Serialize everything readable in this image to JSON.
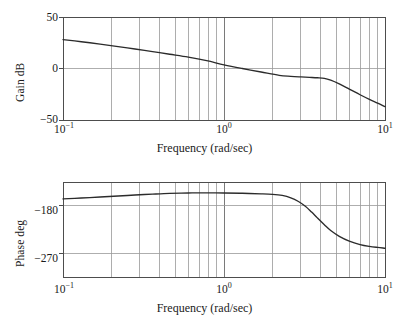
{
  "chart_data": [
    {
      "type": "line",
      "id": "gain",
      "title": "",
      "xlabel": "Frequency (rad/sec)",
      "ylabel": "Gain dB",
      "xscale": "log",
      "xlim": [
        0.1,
        10
      ],
      "ylim": [
        -50,
        50
      ],
      "grid": true,
      "legend": null,
      "xticks": [
        0.1,
        1,
        10
      ],
      "xticklabels": [
        "10−1",
        "10⁰",
        "10¹"
      ],
      "yticks": [
        50,
        0,
        -50
      ],
      "yticklabels": [
        "50",
        "0",
        "−50"
      ],
      "x": [
        0.1,
        0.13,
        0.17,
        0.22,
        0.28,
        0.36,
        0.46,
        0.6,
        0.78,
        1.0,
        1.3,
        1.7,
        2.2,
        2.6,
        3.0,
        3.4,
        3.8,
        4.2,
        4.6,
        5.2,
        6.0,
        7.0,
        8.0,
        9.0,
        10.0
      ],
      "values": [
        28.0,
        26.0,
        23.7,
        21.3,
        18.9,
        16.4,
        13.8,
        11.0,
        7.6,
        3.6,
        0.0,
        -3.4,
        -6.6,
        -7.6,
        -8.2,
        -8.6,
        -9.0,
        -9.6,
        -11.4,
        -15.0,
        -20.0,
        -25.5,
        -30.0,
        -33.6,
        -37.0
      ]
    },
    {
      "type": "line",
      "id": "phase",
      "title": "",
      "xlabel": "Frequency (rad/sec)",
      "ylabel": "Phase deg",
      "xscale": "log",
      "xlim": [
        0.1,
        10
      ],
      "ylim": [
        -315,
        -135
      ],
      "grid": true,
      "legend": null,
      "xticks": [
        0.1,
        1,
        10
      ],
      "xticklabels": [
        "10−1",
        "10⁰",
        "10¹"
      ],
      "yticks": [
        -180,
        -270
      ],
      "yticklabels": [
        "−180",
        "−270"
      ],
      "x": [
        0.1,
        0.13,
        0.17,
        0.22,
        0.28,
        0.36,
        0.46,
        0.6,
        0.78,
        1.0,
        1.3,
        1.7,
        2.0,
        2.3,
        2.6,
        2.9,
        3.2,
        3.5,
        3.8,
        4.2,
        4.6,
        5.2,
        6.0,
        7.0,
        8.0,
        9.0,
        10.0
      ],
      "values": [
        -167.0,
        -165.4,
        -163.5,
        -161.6,
        -159.7,
        -158.0,
        -156.6,
        -155.8,
        -155.6,
        -155.8,
        -156.4,
        -157.4,
        -158.4,
        -160.5,
        -165.0,
        -172.0,
        -181.0,
        -192.0,
        -203.0,
        -216.0,
        -227.0,
        -238.0,
        -247.0,
        -253.5,
        -257.0,
        -259.0,
        -260.5
      ]
    }
  ],
  "gain_plot": {
    "ylabel": "Gain dB",
    "xlabel": "Frequency (rad/sec)",
    "ytick_top": "50",
    "ytick_mid": "0",
    "ytick_bot": "−50",
    "xtick_left_base": "10",
    "xtick_left_exp": "−1",
    "xtick_mid_base": "10",
    "xtick_mid_exp": "0",
    "xtick_right_base": "10",
    "xtick_right_exp": "1"
  },
  "phase_plot": {
    "ylabel": "Phase deg",
    "xlabel": "Frequency (rad/sec)",
    "ytick_180": "−180",
    "ytick_270": "−270",
    "xtick_left_base": "10",
    "xtick_left_exp": "−1",
    "xtick_mid_base": "10",
    "xtick_mid_exp": "0",
    "xtick_right_base": "10",
    "xtick_right_exp": "1"
  },
  "style": {
    "curve_color": "#2b2b2b",
    "grid_color": "#6b6b6b",
    "minor_grid_color": "#8a8a8a",
    "axis_color": "#4d4d4d",
    "background": "#ffffff"
  }
}
